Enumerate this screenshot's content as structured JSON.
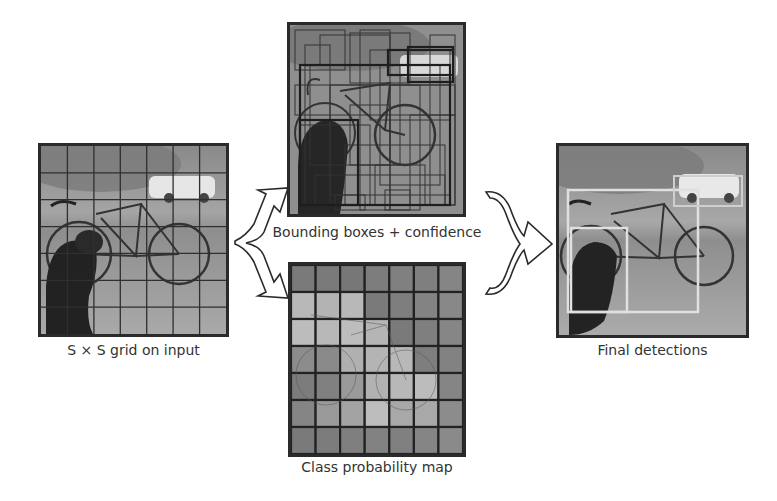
{
  "figure": {
    "panels": {
      "input": {
        "label": "S × S grid on input",
        "grid_size": 7
      },
      "boxes": {
        "label": "Bounding boxes + confidence"
      },
      "classmap": {
        "label": "Class probability map",
        "grid_size": 7,
        "cell_shades": [
          [
            "#7a7a7a",
            "#7a7a7a",
            "#777",
            "#7d7d7d",
            "#808080",
            "#7f7f7f",
            "#858585"
          ],
          [
            "#b8b8b8",
            "#b3b3b3",
            "#b8b8b8",
            "#7a7a7a",
            "#7e7e7e",
            "#838383",
            "#888"
          ],
          [
            "#bcbcbc",
            "#b8b8b8",
            "#bdbdbd",
            "#b5b5b5",
            "#7a7a7a",
            "#7f7f7f",
            "#868686"
          ],
          [
            "#8c8c8c",
            "#8a8a8a",
            "#b0b0b0",
            "#b4b4b4",
            "#b8b8b8",
            "#7e7e7e",
            "#828282"
          ],
          [
            "#7c7c7c",
            "#808080",
            "#9a9a9a",
            "#b2b2b2",
            "#b8b8b8",
            "#bcbcbc",
            "#858585"
          ],
          [
            "#858585",
            "#9a9a9a",
            "#a3a3a3",
            "#bdbdbd",
            "#a8a8a8",
            "#a8a8a8",
            "#8c8c8c"
          ],
          [
            "#7a7a7a",
            "#7c7c7c",
            "#7f7f7f",
            "#828282",
            "#808080",
            "#858585",
            "#8a8a8a"
          ]
        ]
      },
      "detections": {
        "label": "Final detections"
      }
    },
    "colors": {
      "border": "#2a2a2a",
      "grid_line": "#2f2f2f",
      "detection_box": "#e0e0e0",
      "label_text": "#333333"
    }
  }
}
